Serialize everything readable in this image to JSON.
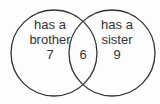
{
  "diagram": {
    "type": "venn",
    "colors": {
      "stroke": "#333333",
      "text": "#333333",
      "background": "#fdfdfd"
    },
    "sets": [
      {
        "id": "brother",
        "label_line1": "has a",
        "label_line2": "brother",
        "only_count": "7"
      },
      {
        "id": "sister",
        "label_line1": "has a",
        "label_line2": "sister",
        "only_count": "9"
      }
    ],
    "intersection": {
      "sets": [
        "brother",
        "sister"
      ],
      "count": "6"
    }
  }
}
